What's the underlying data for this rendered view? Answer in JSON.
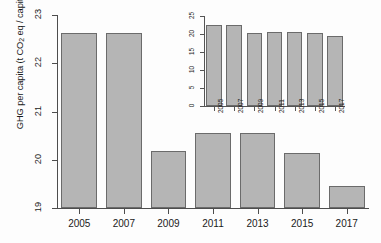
{
  "chart_data": [
    {
      "type": "bar",
      "name": "main-chart",
      "title": "",
      "xlabel": "",
      "ylabel": "GHG per capita (t CO2 eq / capita)",
      "ylabel_parts": {
        "pre": "GHG per capita (t CO",
        "sub": "2",
        "post": " eq / capita)"
      },
      "categories": [
        "2005",
        "2007",
        "2009",
        "2011",
        "2013",
        "2015",
        "2017"
      ],
      "values": [
        22.62,
        22.62,
        20.18,
        20.55,
        20.55,
        20.15,
        19.45
      ],
      "ylim": [
        19,
        23
      ],
      "yticks": [
        "19",
        "20",
        "21",
        "22",
        "23"
      ],
      "ytick_values": [
        19,
        20,
        21,
        22,
        23
      ],
      "grid": false,
      "legend": "none",
      "bar_fill": "#b5b5b5",
      "bar_border": "#6b6b6b"
    },
    {
      "type": "bar",
      "name": "inset-chart",
      "title": "",
      "xlabel": "",
      "ylabel": "",
      "categories": [
        "2005",
        "2007",
        "2009",
        "2011",
        "2013",
        "2015",
        "2017"
      ],
      "values": [
        22.62,
        22.62,
        20.18,
        20.55,
        20.55,
        20.15,
        19.45
      ],
      "ylim": [
        0,
        25
      ],
      "yticks": [
        "0",
        "5",
        "10",
        "15",
        "20",
        "25"
      ],
      "ytick_values": [
        0,
        5,
        10,
        15,
        20,
        25
      ],
      "grid": false,
      "legend": "none",
      "bar_fill": "#b5b5b5",
      "bar_border": "#6b6b6b"
    }
  ]
}
